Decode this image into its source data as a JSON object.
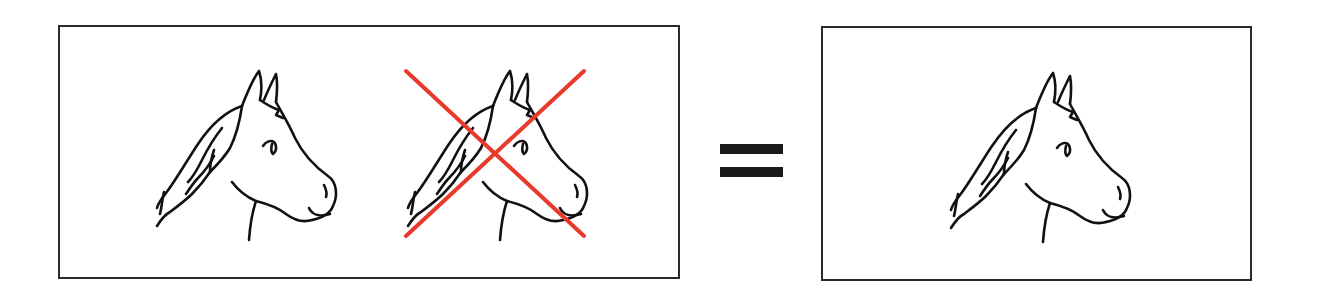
{
  "figure": {
    "left_panel": {
      "items": [
        {
          "id": "horse-1",
          "kind": "horse-head-icon",
          "crossed_out": false
        },
        {
          "id": "horse-2",
          "kind": "horse-head-icon",
          "crossed_out": true
        }
      ]
    },
    "operator": {
      "symbol": "=",
      "icon": "equals-icon"
    },
    "right_panel": {
      "items": [
        {
          "id": "horse-3",
          "kind": "horse-head-icon",
          "crossed_out": false
        }
      ]
    }
  },
  "colors": {
    "cross": "#e8392b",
    "line": "#111111",
    "frame": "#2b2b2b",
    "operator": "#1a1a1a",
    "background": "#ffffff"
  }
}
